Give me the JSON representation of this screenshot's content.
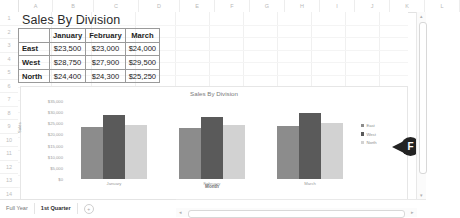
{
  "spreadsheet": {
    "columns": [
      "A",
      "B",
      "C",
      "D",
      "E",
      "F",
      "G",
      "H",
      "I",
      "J",
      "K",
      "L"
    ],
    "column_widths": [
      33,
      40,
      44,
      40,
      34,
      34,
      34,
      34,
      34,
      34,
      34,
      34
    ],
    "rows": [
      "1",
      "2",
      "3",
      "4",
      "5",
      "6",
      "7",
      "8",
      "9",
      "10",
      "11",
      "12",
      "13",
      "14",
      "15"
    ],
    "title_cell": "Sales By Division"
  },
  "table": {
    "corner": "",
    "headers": [
      "January",
      "February",
      "March"
    ],
    "rows": [
      {
        "division": "East",
        "values": [
          "$23,500",
          "$23,000",
          "$24,000"
        ]
      },
      {
        "division": "West",
        "values": [
          "$28,750",
          "$27,900",
          "$29,500"
        ]
      },
      {
        "division": "North",
        "values": [
          "$24,400",
          "$24,300",
          "$25,250"
        ]
      }
    ]
  },
  "chart_data": {
    "type": "bar",
    "title": "Sales By Division",
    "xlabel": "Month",
    "ylabel": "Sales",
    "categories": [
      "January",
      "February",
      "March"
    ],
    "series": [
      {
        "name": "East",
        "values": [
          23500,
          23000,
          24000
        ],
        "color": "#8c8c8c"
      },
      {
        "name": "West",
        "values": [
          28750,
          27900,
          29500
        ],
        "color": "#5a5a5a"
      },
      {
        "name": "North",
        "values": [
          24400,
          24300,
          25250
        ],
        "color": "#d2d2d2"
      }
    ],
    "ylim": [
      0,
      35000
    ],
    "ytick_labels": [
      "$35,000",
      "$30,000",
      "$25,000",
      "$20,000",
      "$15,000",
      "$10,000",
      "$5,000",
      "$0"
    ],
    "ytick_values": [
      35000,
      30000,
      25000,
      20000,
      15000,
      10000,
      5000,
      0
    ],
    "grid": false,
    "legend_position": "right"
  },
  "callout": {
    "label": "F"
  },
  "sheet_tabs": {
    "tabs": [
      {
        "label": "Full Year",
        "active": false
      },
      {
        "label": "1st Quarter",
        "active": true
      }
    ],
    "add_label": "+"
  },
  "scrollbars": {
    "up_arrow": "▴",
    "down_arrow": "▾",
    "left_arrow": "◂",
    "right_arrow": "▸"
  }
}
